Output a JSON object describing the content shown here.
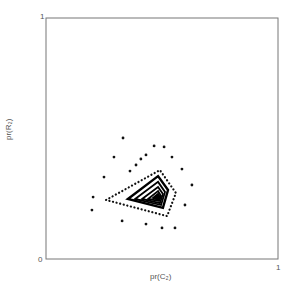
{
  "chart_data": {
    "type": "scatter",
    "title": "",
    "xlabel": "pr(C₂)",
    "ylabel": "pr(R₂)",
    "xlim": [
      0,
      1
    ],
    "ylim": [
      0,
      1
    ],
    "x_ticks": [
      "0",
      "1"
    ],
    "y_ticks": [
      "0",
      "1"
    ],
    "grid": false,
    "legend": null,
    "series": [
      {
        "name": "scatter points",
        "points": [
          [
            0.332,
            0.502
          ],
          [
            0.293,
            0.423
          ],
          [
            0.466,
            0.469
          ],
          [
            0.509,
            0.465
          ],
          [
            0.431,
            0.432
          ],
          [
            0.543,
            0.423
          ],
          [
            0.25,
            0.34
          ],
          [
            0.586,
            0.373
          ],
          [
            0.629,
            0.307
          ],
          [
            0.203,
            0.257
          ],
          [
            0.599,
            0.224
          ],
          [
            0.198,
            0.203
          ],
          [
            0.328,
            0.158
          ],
          [
            0.431,
            0.145
          ],
          [
            0.5,
            0.129
          ],
          [
            0.556,
            0.129
          ],
          [
            0.409,
            0.415
          ],
          [
            0.388,
            0.39
          ],
          [
            0.362,
            0.365
          ]
        ]
      },
      {
        "name": "dotted outer polygon",
        "polygon": [
          [
            0.259,
            0.245
          ],
          [
            0.491,
            0.369
          ],
          [
            0.56,
            0.274
          ],
          [
            0.522,
            0.178
          ]
        ]
      },
      {
        "name": "contour levels",
        "polygons": [
          [
            [
              0.353,
              0.249
            ],
            [
              0.483,
              0.344
            ],
            [
              0.526,
              0.286
            ],
            [
              0.504,
              0.212
            ]
          ],
          [
            [
              0.384,
              0.249
            ],
            [
              0.483,
              0.32
            ],
            [
              0.513,
              0.278
            ],
            [
              0.496,
              0.224
            ]
          ],
          [
            [
              0.414,
              0.249
            ],
            [
              0.483,
              0.299
            ],
            [
              0.504,
              0.27
            ],
            [
              0.491,
              0.232
            ]
          ],
          [
            [
              0.44,
              0.249
            ],
            [
              0.483,
              0.282
            ],
            [
              0.496,
              0.261
            ],
            [
              0.487,
              0.241
            ]
          ],
          [
            [
              0.461,
              0.253
            ],
            [
              0.483,
              0.27
            ],
            [
              0.491,
              0.257
            ],
            [
              0.483,
              0.245
            ]
          ]
        ]
      }
    ]
  },
  "labels": {
    "x_tick_0": "0",
    "x_tick_1": "1",
    "y_tick_1": "1",
    "xlabel": "pr(C₂)",
    "ylabel": "pr(R₂)"
  }
}
